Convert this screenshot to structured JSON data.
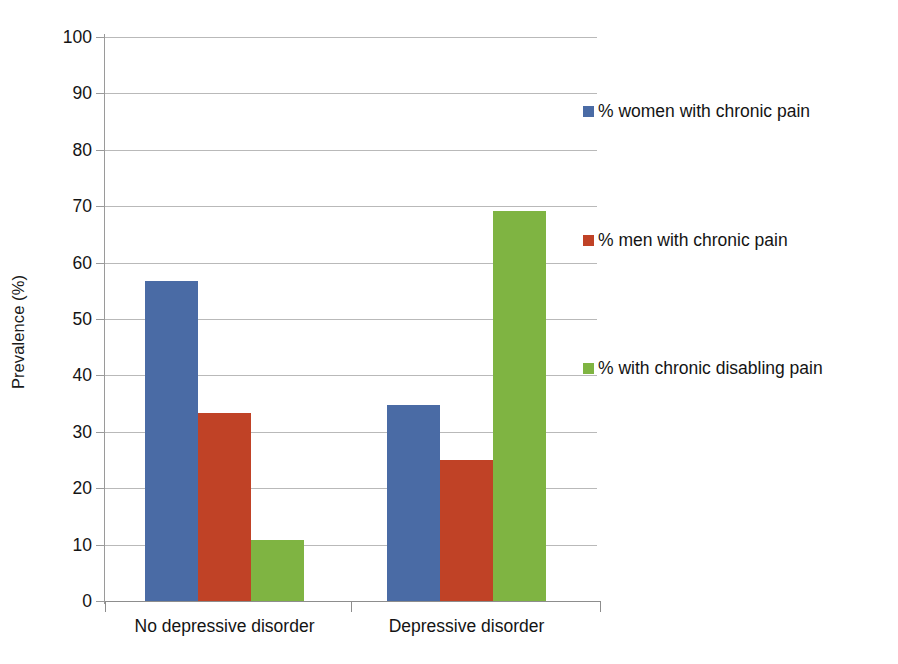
{
  "chart_data": {
    "type": "bar",
    "title": "",
    "subtitle": "",
    "xlabel": "",
    "ylabel": "Prevalence (%)",
    "categories": [
      "No depressive disorder",
      "Depressive disorder"
    ],
    "series": [
      {
        "name": "% women with chronic pain",
        "color": "#4A6BA5",
        "values": [
          56.7,
          34.7
        ]
      },
      {
        "name": "% men with chronic pain",
        "color": "#C04226",
        "values": [
          33.3,
          25.0
        ]
      },
      {
        "name": "% with chronic disabling pain",
        "color": "#7FB442",
        "values": [
          10.8,
          69.2
        ]
      }
    ],
    "ylim": [
      0,
      100
    ],
    "ytick_labels": [
      "0",
      "10",
      "20",
      "30",
      "40",
      "50",
      "60",
      "70",
      "80",
      "90",
      "100"
    ],
    "ytick_values": [
      0,
      10,
      20,
      30,
      40,
      50,
      60,
      70,
      80,
      90,
      100
    ],
    "grid": "horizontal",
    "legend_position": "right",
    "legend": [
      {
        "label": "% women with chronic pain",
        "color": "#4A6BA5"
      },
      {
        "label": "% men with chronic pain",
        "color": "#C04226"
      },
      {
        "label": "% with chronic disabling pain",
        "color": "#7FB442"
      }
    ],
    "colors": {
      "women": "#4A6BA5",
      "men": "#C04226",
      "disabling": "#7FB442",
      "gridline": "#b9b9b9",
      "axis": "#8d8d8d",
      "text": "#141414",
      "background": "#ffffff"
    }
  }
}
